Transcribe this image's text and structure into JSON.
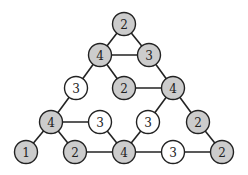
{
  "diagram": {
    "type": "graph",
    "colors": {
      "filled": "#cccccc",
      "empty": "#ffffff",
      "stroke": "#222222"
    },
    "nodes": [
      {
        "id": "n0",
        "label": "2",
        "filled": true
      },
      {
        "id": "n1",
        "label": "4",
        "filled": true
      },
      {
        "id": "n2",
        "label": "3",
        "filled": true
      },
      {
        "id": "n3",
        "label": "3",
        "filled": false
      },
      {
        "id": "n4",
        "label": "2",
        "filled": true
      },
      {
        "id": "n5",
        "label": "4",
        "filled": true
      },
      {
        "id": "n6",
        "label": "4",
        "filled": true
      },
      {
        "id": "n7",
        "label": "3",
        "filled": false
      },
      {
        "id": "n8",
        "label": "3",
        "filled": false
      },
      {
        "id": "n9",
        "label": "2",
        "filled": true
      },
      {
        "id": "n10",
        "label": "1",
        "filled": true
      },
      {
        "id": "n11",
        "label": "2",
        "filled": true
      },
      {
        "id": "n12",
        "label": "4",
        "filled": true
      },
      {
        "id": "n13",
        "label": "3",
        "filled": false
      },
      {
        "id": "n14",
        "label": "2",
        "filled": true
      }
    ],
    "edges": [
      [
        "n0",
        "n1"
      ],
      [
        "n0",
        "n2"
      ],
      [
        "n1",
        "n2"
      ],
      [
        "n1",
        "n3"
      ],
      [
        "n1",
        "n4"
      ],
      [
        "n2",
        "n5"
      ],
      [
        "n4",
        "n5"
      ],
      [
        "n3",
        "n6"
      ],
      [
        "n5",
        "n8"
      ],
      [
        "n5",
        "n9"
      ],
      [
        "n6",
        "n7"
      ],
      [
        "n6",
        "n10"
      ],
      [
        "n6",
        "n11"
      ],
      [
        "n7",
        "n12"
      ],
      [
        "n8",
        "n12"
      ],
      [
        "n9",
        "n14"
      ],
      [
        "n11",
        "n12"
      ],
      [
        "n12",
        "n13"
      ],
      [
        "n13",
        "n14"
      ]
    ]
  }
}
